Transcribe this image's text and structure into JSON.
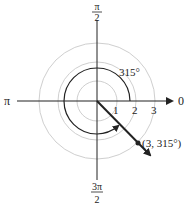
{
  "diagram": {
    "type": "polar-coordinate-plot",
    "axes": {
      "right_label": "0",
      "left_label": "π",
      "top_label": {
        "num": "π",
        "den": "2"
      },
      "bottom_label": {
        "num": "3π",
        "den": "2"
      }
    },
    "rings": [
      {
        "radius": 1,
        "label": "1"
      },
      {
        "radius": 2,
        "label": "2"
      },
      {
        "radius": 3,
        "label": "3"
      }
    ],
    "angle_arc": {
      "label": "315°",
      "direction": "counterclockwise"
    },
    "point": {
      "label": "(3, 315°)",
      "r": 3,
      "theta_deg": 315
    },
    "colors": {
      "ring": "#cfcfcf",
      "ink": "#222222"
    }
  }
}
